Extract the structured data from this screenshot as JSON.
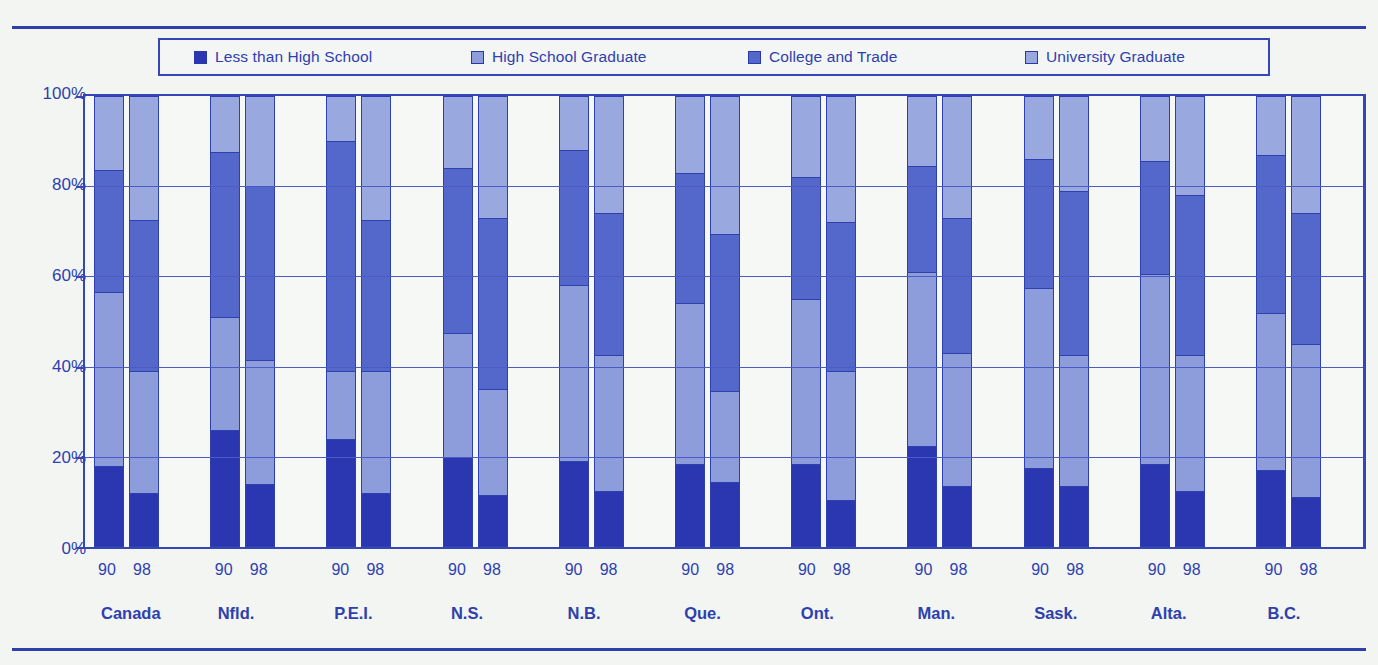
{
  "chart_data": {
    "type": "bar",
    "subtype": "stacked-percentage",
    "title": "",
    "xlabel": "",
    "ylabel": "",
    "ylim": [
      0,
      100
    ],
    "yticks": [
      "0%",
      "20%",
      "40%",
      "60%",
      "80%",
      "100%"
    ],
    "ytick_values": [
      0,
      20,
      40,
      60,
      80,
      100
    ],
    "grid": true,
    "legend_position": "top",
    "categories": [
      "Canada",
      "Nfld.",
      "P.E.I.",
      "N.S.",
      "N.B.",
      "Que.",
      "Ont.",
      "Man.",
      "Sask.",
      "Alta.",
      "B.C."
    ],
    "subcategories": [
      "90",
      "98"
    ],
    "series": [
      {
        "name": "Less than High School",
        "color": "#2b37b0",
        "values_90": [
          18,
          26,
          24,
          20,
          19,
          18.5,
          18.5,
          22.5,
          17.5,
          18.5,
          17
        ],
        "values_98": [
          12,
          14,
          12,
          11.5,
          12.5,
          14.5,
          10.5,
          13.5,
          13.5,
          12.5,
          11
        ]
      },
      {
        "name": "High School Graduate",
        "color": "#8d9ddc",
        "values_90": [
          38.5,
          25,
          15,
          27.5,
          39,
          35.5,
          36.5,
          38.5,
          40,
          42,
          35
        ],
        "values_98": [
          27,
          27.5,
          27,
          23.5,
          30,
          20,
          28.5,
          29.5,
          29,
          30,
          34
        ]
      },
      {
        "name": "College and Trade",
        "color": "#5468cc",
        "values_90": [
          27,
          36.5,
          51,
          36,
          30,
          29,
          27,
          23.5,
          28.5,
          25,
          35
        ]
      },
      {
        "name": "University Graduate",
        "color": "#9aa8e0",
        "values_90": [
          16.5,
          12.5,
          10,
          16,
          12,
          17,
          18,
          15.5,
          14,
          14.5,
          13
        ],
        "values_98": [
          27,
          20,
          27.5,
          27,
          26,
          30.5,
          28,
          27,
          21,
          22,
          26
        ]
      }
    ],
    "stacks": [
      {
        "region": "Canada",
        "bars": [
          {
            "year": "90",
            "segments": [
              18,
              38.5,
              27,
              16.5
            ]
          },
          {
            "year": "98",
            "segments": [
              12,
              27,
              33.5,
              27.5
            ]
          }
        ]
      },
      {
        "region": "Nfld.",
        "bars": [
          {
            "year": "90",
            "segments": [
              26,
              25,
              36.5,
              12.5
            ]
          },
          {
            "year": "98",
            "segments": [
              14,
              27.5,
              38.5,
              20
            ]
          }
        ]
      },
      {
        "region": "P.E.I.",
        "bars": [
          {
            "year": "90",
            "segments": [
              24,
              15,
              51,
              10
            ]
          },
          {
            "year": "98",
            "segments": [
              12,
              27,
              33.5,
              27.5
            ]
          }
        ]
      },
      {
        "region": "N.S.",
        "bars": [
          {
            "year": "90",
            "segments": [
              20,
              27.5,
              36.5,
              16
            ]
          },
          {
            "year": "98",
            "segments": [
              11.5,
              23.5,
              38,
              27
            ]
          }
        ]
      },
      {
        "region": "N.B.",
        "bars": [
          {
            "year": "90",
            "segments": [
              19,
              39,
              30,
              12
            ]
          },
          {
            "year": "98",
            "segments": [
              12.5,
              30,
              31.5,
              26
            ]
          }
        ]
      },
      {
        "region": "Que.",
        "bars": [
          {
            "year": "90",
            "segments": [
              18.5,
              35.5,
              29,
              17
            ]
          },
          {
            "year": "98",
            "segments": [
              14.5,
              20,
              35,
              30.5
            ]
          }
        ]
      },
      {
        "region": "Ont.",
        "bars": [
          {
            "year": "90",
            "segments": [
              18.5,
              36.5,
              27,
              18
            ]
          },
          {
            "year": "98",
            "segments": [
              10.5,
              28.5,
              33,
              28
            ]
          }
        ]
      },
      {
        "region": "Man.",
        "bars": [
          {
            "year": "90",
            "segments": [
              22.5,
              38.5,
              23.5,
              15.5
            ]
          },
          {
            "year": "98",
            "segments": [
              13.5,
              29.5,
              30,
              27
            ]
          }
        ]
      },
      {
        "region": "Sask.",
        "bars": [
          {
            "year": "90",
            "segments": [
              17.5,
              40,
              28.5,
              14
            ]
          },
          {
            "year": "98",
            "segments": [
              13.5,
              29,
              36.5,
              21
            ]
          }
        ]
      },
      {
        "region": "Alta.",
        "bars": [
          {
            "year": "90",
            "segments": [
              18.5,
              42,
              25,
              14.5
            ]
          },
          {
            "year": "98",
            "segments": [
              12.5,
              30,
              35.5,
              22
            ]
          }
        ]
      },
      {
        "region": "B.C.",
        "bars": [
          {
            "year": "90",
            "segments": [
              17,
              35,
              35,
              13
            ]
          },
          {
            "year": "98",
            "segments": [
              11,
              34,
              29,
              26
            ]
          }
        ]
      }
    ]
  },
  "legend": {
    "items": [
      {
        "label": "Less than High School",
        "color": "#2b37b0"
      },
      {
        "label": "High School Graduate",
        "color": "#8d9ddc"
      },
      {
        "label": "College and Trade",
        "color": "#5468cc"
      },
      {
        "label": "University Graduate",
        "color": "#9aa8e0"
      }
    ]
  },
  "axis": {
    "y_labels": [
      "100%",
      "80%",
      "60%",
      "40%",
      "20%",
      "0%"
    ],
    "y_values": [
      100,
      80,
      60,
      40,
      20,
      0
    ]
  },
  "colors": {
    "axis": "#2e3fae",
    "grid": "#4a5cc4",
    "frame": "#3446b8",
    "plot_background": "#f6f8f6",
    "page_background": "#f3f5f3",
    "segment_border": "#2e3fae"
  }
}
